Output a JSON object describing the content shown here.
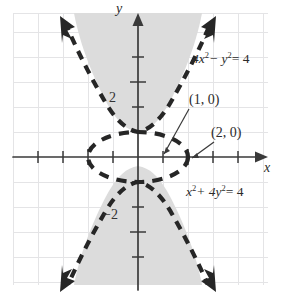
{
  "figure": {
    "kind": "conic-sections-graph",
    "background": "#ffffff",
    "ink_color": "#2b2b2b",
    "grid_color": "#e2e2e4",
    "shade_color": "#dcdcdc",
    "origin_px": {
      "x": 138,
      "y": 157
    },
    "unit_px": 25
  },
  "axes": {
    "x_label": "x",
    "y_label": "y",
    "x_label_pos": {
      "x": 265,
      "y": 168
    },
    "y_label_pos": {
      "x": 117,
      "y": 8
    },
    "x_range": [
      -5.4,
      5.4
    ],
    "y_range": [
      -5.4,
      5.4
    ],
    "tick_labels": [
      {
        "text": "2",
        "axis": "y",
        "value": 2,
        "x": 110,
        "y": 99
      },
      {
        "text": "−2",
        "axis": "y",
        "value": -2,
        "x": 104,
        "y": 216
      }
    ]
  },
  "curves": [
    {
      "name": "hyperbola",
      "equation": "4x² − y² = 4",
      "label_text_parts": {
        "a": "4x",
        "sup1": "2",
        "op": "− y",
        "sup2": "2",
        "eq": "= 4"
      },
      "label_pos": {
        "x": 192,
        "y": 60
      },
      "style": "dashed",
      "has_arrowheads": true
    },
    {
      "name": "ellipse",
      "equation": "x² + 4y² = 4",
      "label_text_parts": {
        "a": "x",
        "sup1": "2",
        "op": "+ 4y",
        "sup2": "2",
        "eq": "= 4"
      },
      "label_pos": {
        "x": 186,
        "y": 193
      },
      "style": "dashed",
      "has_arrowheads": false
    }
  ],
  "annotations": [
    {
      "name": "point-1-0",
      "text": "(1, 0)",
      "x": 191,
      "y": 100,
      "leader_to": {
        "x": 163,
        "y": 155
      }
    },
    {
      "name": "point-2-0",
      "text": "(2, 0)",
      "x": 213,
      "y": 133,
      "leader_to": {
        "x": 195,
        "y": 160
      }
    }
  ],
  "shaded_region": {
    "description": "solution region between hyperbola branches and outside/above ellipse",
    "fill": "#dcdcdc"
  }
}
